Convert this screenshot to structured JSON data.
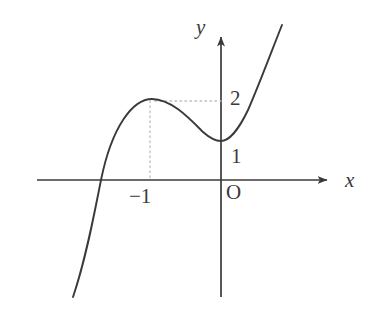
{
  "figure": {
    "kind": "cartesian-graph",
    "width": 384,
    "height": 318,
    "background_color": "#ffffff",
    "ink_color": "#3a3a3a",
    "guide_color": "#c8c8c8"
  },
  "axes": {
    "x_axis": {
      "label": "x",
      "arrow": "right",
      "origin_px": {
        "x": 221,
        "y": 180
      },
      "start_px": {
        "x": 37,
        "y": 180
      },
      "end_px": {
        "x": 333,
        "y": 180
      }
    },
    "y_axis": {
      "label": "y",
      "arrow": "up",
      "start_px": {
        "x": 221,
        "y": 297
      },
      "end_px": {
        "x": 221,
        "y": 30
      }
    },
    "origin_label": "O"
  },
  "tick_labels": [
    {
      "name": "y-value-2",
      "text": "2",
      "axis": "y",
      "value": 2
    },
    {
      "name": "y-value-1",
      "text": "1",
      "axis": "y",
      "value": 1
    },
    {
      "name": "x-value-minus-1",
      "text": "−1",
      "axis": "x",
      "value": -1
    }
  ],
  "guides": [
    {
      "name": "horizontal-guide-to-local-max",
      "orientation": "horizontal",
      "style": "dotted",
      "from_px": {
        "x": 155,
        "y": 101
      },
      "to_px": {
        "x": 221,
        "y": 101
      }
    },
    {
      "name": "vertical-guide-to-local-max",
      "orientation": "vertical",
      "style": "dotted",
      "from_px": {
        "x": 150,
        "y": 101
      },
      "to_px": {
        "x": 150,
        "y": 180
      }
    }
  ],
  "chart_data": {
    "type": "line",
    "title": "",
    "xlabel": "x",
    "ylabel": "y",
    "grid": false,
    "legend": null,
    "curve_name": "cubic-curve",
    "annotations": [
      {
        "label": "local maximum",
        "x": -1,
        "y": 2
      },
      {
        "label": "local minimum",
        "x": 0,
        "y": 1
      },
      {
        "label": "x-intercept",
        "x": -1.84,
        "y": 0
      }
    ],
    "path_px": "M 73,297 C 86,259 94,215 101,180 C 112,126 133,99 152,99 C 171,99 189,118 203,132 C 212,140 217,141 221,141 C 229,141 239,129 248,110 C 259,85 272,50 282,25",
    "x": [
      -2.0,
      -1.84,
      -1.6,
      -1.4,
      -1.2,
      -1.0,
      -0.8,
      -0.6,
      -0.4,
      -0.2,
      0.0,
      0.2,
      0.4,
      0.6,
      0.8,
      1.0
    ],
    "y": [
      -1.0,
      0.0,
      0.98,
      1.53,
      1.87,
      2.0,
      1.95,
      1.78,
      1.51,
      1.24,
      1.0,
      1.02,
      1.14,
      1.44,
      1.98,
      3.0
    ],
    "xlim": [
      -2.3,
      1.4
    ],
    "ylim": [
      -1.6,
      3.4
    ]
  }
}
